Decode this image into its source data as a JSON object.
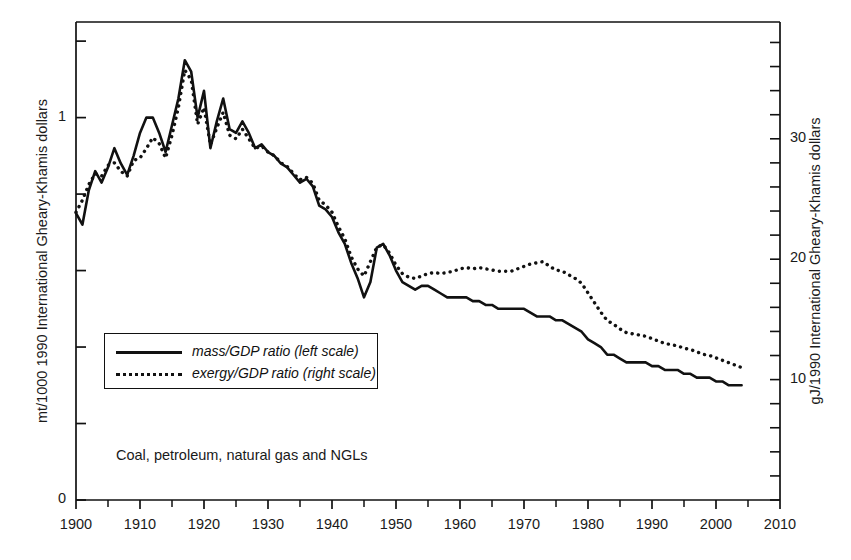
{
  "axes": {
    "left_label": "mt/1000 1990 International Gheary-Khamis dollars",
    "right_label": "gJ/1990 International Gheary-Khamis dollars",
    "left_ticks": [
      "1",
      "0"
    ],
    "right_ticks": [
      "30",
      "20",
      "10"
    ],
    "x_ticks": [
      "1900",
      "1910",
      "1920",
      "1930",
      "1940",
      "1950",
      "1960",
      "1970",
      "1980",
      "1990",
      "2000",
      "2010"
    ]
  },
  "legend": {
    "items": [
      {
        "label": "mass/GDP ratio (left scale)",
        "style": "solid"
      },
      {
        "label": "exergy/GDP ratio (right scale)",
        "style": "dotted"
      }
    ]
  },
  "annotation": "Coal, petroleum, natural gas and NGLs",
  "chart_data": {
    "type": "line",
    "title": "",
    "xlabel": "",
    "ylabel": "mt/1000 1990 International Gheary-Khamis dollars",
    "y2label": "gJ/1990 International Gheary-Khamis dollars",
    "xlim": [
      1900,
      2010
    ],
    "ylim": [
      0,
      1.25
    ],
    "y2lim": [
      0,
      39.7
    ],
    "grid": false,
    "legend_position": "center-left",
    "x_tick_step": 10,
    "x_minor_tick_step": 5,
    "annotation_text": "Coal, petroleum, natural gas and NGLs",
    "series": [
      {
        "name": "mass/GDP ratio (left scale)",
        "axis": "left",
        "style": "solid",
        "color": "#111111",
        "x": [
          1900,
          1901,
          1902,
          1903,
          1904,
          1905,
          1906,
          1907,
          1908,
          1909,
          1910,
          1911,
          1912,
          1913,
          1914,
          1915,
          1916,
          1917,
          1918,
          1919,
          1920,
          1921,
          1922,
          1923,
          1924,
          1925,
          1926,
          1927,
          1928,
          1929,
          1930,
          1931,
          1932,
          1933,
          1934,
          1935,
          1936,
          1937,
          1938,
          1939,
          1940,
          1941,
          1942,
          1943,
          1944,
          1945,
          1946,
          1947,
          1948,
          1949,
          1950,
          1951,
          1952,
          1953,
          1954,
          1955,
          1956,
          1957,
          1958,
          1959,
          1960,
          1961,
          1962,
          1963,
          1964,
          1965,
          1966,
          1967,
          1968,
          1969,
          1970,
          1971,
          1972,
          1973,
          1974,
          1975,
          1976,
          1977,
          1978,
          1979,
          1980,
          1981,
          1982,
          1983,
          1984,
          1985,
          1986,
          1987,
          1988,
          1989,
          1990,
          1991,
          1992,
          1993,
          1994,
          1995,
          1996,
          1997,
          1998,
          1999,
          2000,
          2001,
          2002,
          2003,
          2004
        ],
        "y": [
          0.75,
          0.72,
          0.81,
          0.86,
          0.83,
          0.87,
          0.92,
          0.88,
          0.85,
          0.9,
          0.96,
          1.0,
          1.0,
          0.96,
          0.91,
          0.98,
          1.05,
          1.15,
          1.12,
          1.0,
          1.07,
          0.92,
          0.99,
          1.05,
          0.97,
          0.96,
          0.99,
          0.96,
          0.92,
          0.93,
          0.91,
          0.9,
          0.88,
          0.87,
          0.85,
          0.83,
          0.84,
          0.82,
          0.77,
          0.76,
          0.74,
          0.7,
          0.67,
          0.62,
          0.58,
          0.53,
          0.57,
          0.66,
          0.67,
          0.64,
          0.6,
          0.57,
          0.56,
          0.55,
          0.56,
          0.56,
          0.55,
          0.54,
          0.53,
          0.53,
          0.53,
          0.53,
          0.52,
          0.52,
          0.51,
          0.51,
          0.5,
          0.5,
          0.5,
          0.5,
          0.5,
          0.49,
          0.48,
          0.48,
          0.48,
          0.47,
          0.47,
          0.46,
          0.45,
          0.44,
          0.42,
          0.41,
          0.4,
          0.38,
          0.38,
          0.37,
          0.36,
          0.36,
          0.36,
          0.36,
          0.35,
          0.35,
          0.34,
          0.34,
          0.34,
          0.33,
          0.33,
          0.32,
          0.32,
          0.32,
          0.31,
          0.31,
          0.3,
          0.3,
          0.3
        ]
      },
      {
        "name": "exergy/GDP ratio (right scale)",
        "axis": "right",
        "style": "dotted",
        "color": "#111111",
        "x": [
          1900,
          1901,
          1902,
          1903,
          1904,
          1905,
          1906,
          1907,
          1908,
          1909,
          1910,
          1911,
          1912,
          1913,
          1914,
          1915,
          1916,
          1917,
          1918,
          1919,
          1920,
          1921,
          1922,
          1923,
          1924,
          1925,
          1926,
          1927,
          1928,
          1929,
          1930,
          1931,
          1932,
          1933,
          1934,
          1935,
          1936,
          1937,
          1938,
          1939,
          1940,
          1941,
          1942,
          1943,
          1944,
          1945,
          1946,
          1947,
          1948,
          1949,
          1950,
          1951,
          1952,
          1953,
          1954,
          1955,
          1956,
          1957,
          1958,
          1959,
          1960,
          1961,
          1962,
          1963,
          1964,
          1965,
          1966,
          1967,
          1968,
          1969,
          1970,
          1971,
          1972,
          1973,
          1974,
          1975,
          1976,
          1977,
          1978,
          1979,
          1980,
          1981,
          1982,
          1983,
          1984,
          1985,
          1986,
          1987,
          1988,
          1989,
          1990,
          1991,
          1992,
          1993,
          1994,
          1995,
          1996,
          1997,
          1998,
          1999,
          2000,
          2001,
          2002,
          2003,
          2004
        ],
        "y": [
          23.9,
          24.9,
          26.2,
          27.1,
          26.9,
          27.8,
          28.0,
          27.3,
          26.9,
          28.2,
          28.4,
          29.2,
          30.1,
          29.6,
          28.4,
          30.3,
          32.6,
          35.7,
          34.9,
          31.2,
          32.6,
          29.5,
          30.9,
          32.2,
          30.3,
          30.0,
          30.8,
          30.0,
          29.2,
          29.4,
          28.9,
          28.6,
          28.0,
          27.7,
          27.1,
          26.6,
          26.8,
          26.3,
          24.9,
          24.5,
          23.9,
          22.7,
          21.7,
          20.2,
          19.2,
          18.6,
          19.8,
          21.0,
          21.2,
          20.5,
          19.5,
          18.8,
          18.5,
          18.4,
          18.6,
          18.8,
          18.9,
          18.8,
          18.9,
          19.0,
          19.2,
          19.3,
          19.2,
          19.3,
          19.2,
          19.1,
          19.0,
          19.0,
          19.0,
          19.2,
          19.4,
          19.6,
          19.7,
          19.8,
          19.4,
          19.1,
          19.0,
          18.7,
          18.4,
          18.0,
          17.2,
          16.4,
          15.6,
          14.9,
          14.6,
          14.2,
          13.9,
          13.8,
          13.7,
          13.6,
          13.4,
          13.2,
          13.0,
          12.9,
          12.8,
          12.6,
          12.5,
          12.3,
          12.1,
          12.0,
          11.8,
          11.6,
          11.4,
          11.2,
          11.0
        ]
      }
    ]
  }
}
